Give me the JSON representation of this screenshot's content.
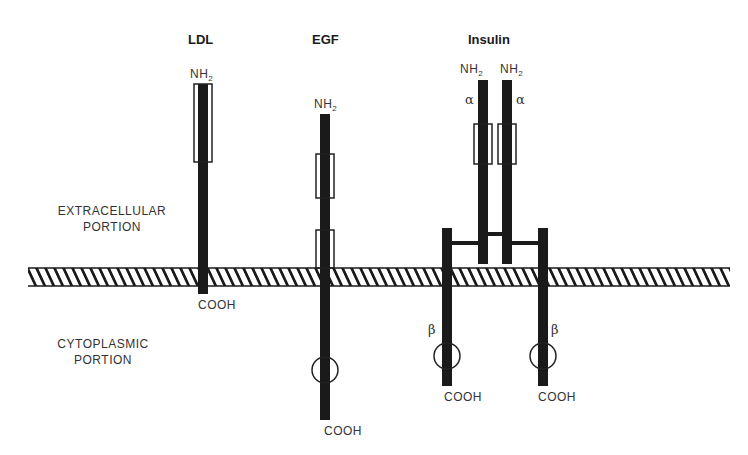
{
  "receptors": [
    {
      "name": "LDL",
      "n_terminus": "NH",
      "n_sub": "2",
      "c_terminus": "COOH"
    },
    {
      "name": "EGF",
      "n_terminus": "NH",
      "n_sub": "2",
      "c_terminus": "COOH"
    },
    {
      "name": "Insulin",
      "alpha_chains": [
        {
          "n_terminus": "NH",
          "n_sub": "2",
          "label": "α"
        },
        {
          "n_terminus": "NH",
          "n_sub": "2",
          "label": "α"
        }
      ],
      "beta_chains": [
        {
          "label": "β",
          "c_terminus": "COOH"
        },
        {
          "label": "β",
          "c_terminus": "COOH"
        }
      ]
    }
  ],
  "regions": {
    "extracellular": {
      "line1": "EXTRACELLULAR",
      "line2": "PORTION"
    },
    "cytoplasmic": {
      "line1": "CYTOPLASMIC",
      "line2": "PORTION"
    }
  },
  "colors": {
    "chain": "#1a1a1a",
    "outline": "#222222",
    "background": "#ffffff"
  }
}
